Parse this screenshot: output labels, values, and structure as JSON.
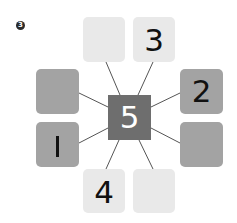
{
  "problem_marker": "3",
  "colors": {
    "light_tile": "#e9e9e9",
    "medium_tile": "#a3a3a3",
    "center_tile": "#6e6e6e",
    "connector": "#555555"
  },
  "center": {
    "label": "5"
  },
  "tiles": {
    "top_left": {
      "label": ""
    },
    "top_right": {
      "label": "3"
    },
    "left_upper": {
      "label": ""
    },
    "left_lower": {
      "label": "1"
    },
    "right_upper": {
      "label": "2"
    },
    "right_lower": {
      "label": ""
    },
    "bottom_left": {
      "label": "4"
    },
    "bottom_right": {
      "label": ""
    }
  }
}
